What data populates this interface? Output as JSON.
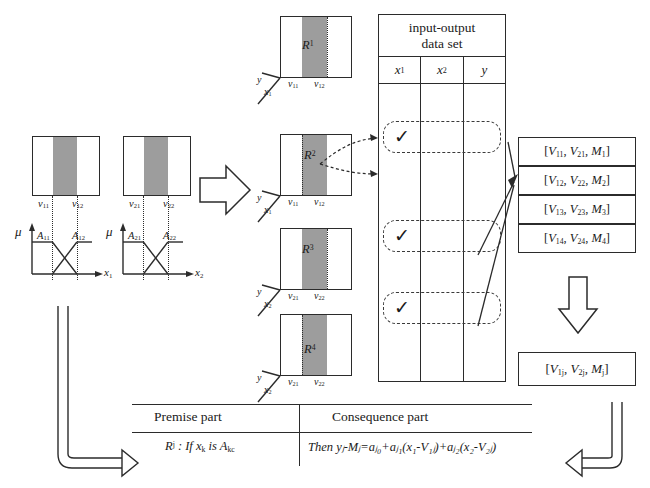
{
  "diagram": {
    "title_text": "Fuzzy rule generation from input-output data set",
    "colors": {
      "ink": "#1a1a1a",
      "band_gray": "#9d9d9d",
      "line": "#2b2b2b"
    }
  },
  "membership_panels": [
    {
      "mu_label": "μ",
      "axis_label": "x",
      "axis_sub": "1",
      "v_left": "v",
      "v_left_sub": "11",
      "v_right": "v",
      "v_right_sub": "12",
      "a_left": "A",
      "a_left_sub": "11",
      "a_right": "A",
      "a_right_sub": "12"
    },
    {
      "mu_label": "μ",
      "axis_label": "x",
      "axis_sub": "2",
      "v_left": "v",
      "v_left_sub": "21",
      "v_right": "v",
      "v_right_sub": "22",
      "a_left": "A",
      "a_left_sub": "21",
      "a_right": "A",
      "a_right_sub": "22"
    }
  ],
  "region_boxes": [
    {
      "label": "R",
      "sup": "1",
      "y_label": "y",
      "x_label": "x",
      "x_sub": "1",
      "v_left": "v",
      "v_left_sub": "11",
      "v_right": "v",
      "v_right_sub": "12",
      "band_left_pct": 30,
      "band_width_pct": 36,
      "dash_side": "right"
    },
    {
      "label": "R",
      "sup": "2",
      "y_label": "y",
      "x_label": "x",
      "x_sub": "1",
      "v_left": "v",
      "v_left_sub": "11",
      "v_right": "v",
      "v_right_sub": "12",
      "band_left_pct": 30,
      "band_width_pct": 36,
      "dash_side": "left"
    },
    {
      "label": "R",
      "sup": "3",
      "y_label": "y",
      "x_label": "x",
      "x_sub": "2",
      "v_left": "v",
      "v_left_sub": "21",
      "v_right": "v",
      "v_right_sub": "22",
      "band_left_pct": 30,
      "band_width_pct": 36,
      "dash_side": "right"
    },
    {
      "label": "R",
      "sup": "4",
      "y_label": "y",
      "x_label": "x",
      "x_sub": "2",
      "v_left": "v",
      "v_left_sub": "21",
      "v_right": "v",
      "v_right_sub": "22",
      "band_left_pct": 30,
      "band_width_pct": 36,
      "dash_side": "left"
    }
  ],
  "dataset_table": {
    "title_line1": "input-output",
    "title_line2": "data set",
    "columns": [
      "x",
      "x",
      "y"
    ],
    "column_subs": [
      "1",
      "2",
      ""
    ],
    "selected_marks": [
      "✓",
      "✓",
      "✓"
    ],
    "mark_count": 3
  },
  "parameter_boxes": [
    {
      "open": "[",
      "v1": "V",
      "v1_sub": "11",
      "v2": "V",
      "v2_sub": "21",
      "m": "M",
      "m_sub": "1",
      "close": "]"
    },
    {
      "open": "[",
      "v1": "V",
      "v1_sub": "12",
      "v2": "V",
      "v2_sub": "22",
      "m": "M",
      "m_sub": "2",
      "close": "]"
    },
    {
      "open": "[",
      "v1": "V",
      "v1_sub": "13",
      "v2": "V",
      "v2_sub": "23",
      "m": "M",
      "m_sub": "3",
      "close": "]"
    },
    {
      "open": "[",
      "v1": "V",
      "v1_sub": "14",
      "v2": "V",
      "v2_sub": "24",
      "m": "M",
      "m_sub": "4",
      "close": "]"
    }
  ],
  "final_box": {
    "open": "[",
    "v1": "V",
    "v1_sub": "1j",
    "v2": "V",
    "v2_sub": "2j",
    "m": "M",
    "m_sub": "j",
    "close": "]"
  },
  "rule": {
    "premise_header": "Premise part",
    "consequence_header": "Consequence part",
    "premise_formula_prefix": "R",
    "premise_formula_sup": "j",
    "premise_formula_rest": " : If  x",
    "premise_formula_x_sub": "k",
    "premise_formula_is": " is A",
    "premise_formula_a_sub": "kc",
    "consequence_formula": "Then yⱼ-Mⱼ=aⱼ₀+aⱼ₁(x₁-V₁ⱼ)+aⱼ₂(x₂-V₂ⱼ)"
  }
}
